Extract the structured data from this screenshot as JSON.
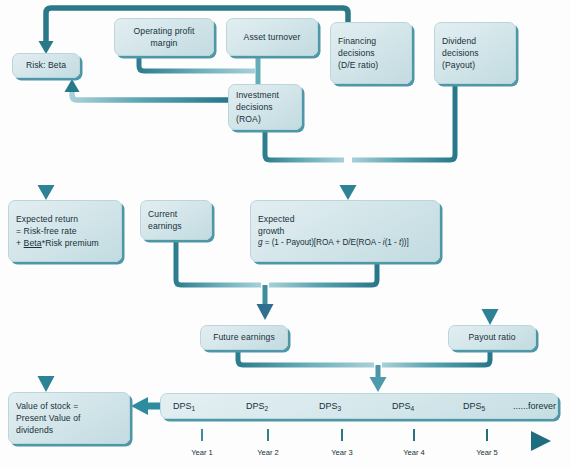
{
  "diagram": {
    "colors": {
      "wire": "#2e8090",
      "wire_dark": "#1d6a7c",
      "wire_light": "#8fc5cf",
      "box_fill": "#d4e6ea",
      "box_border": "#b9d6dd",
      "box_shadow": "#4e97a6",
      "arrow_dark_blue": "#2f6f8f",
      "text": "#18303a",
      "background": "#ffffff"
    },
    "nodes": [
      {
        "id": "risk-beta",
        "label": "Risk: Beta"
      },
      {
        "id": "operating-profit-margin",
        "label": "Operating profit margin"
      },
      {
        "id": "asset-turnover",
        "label": "Asset turnover"
      },
      {
        "id": "financing-decisions",
        "label": "Financing decisions (D/E ratio)"
      },
      {
        "id": "dividend-decisions",
        "label": "Dividend decisions (Payout)"
      },
      {
        "id": "investment-decisions",
        "label": "Investment decisions (ROA)"
      },
      {
        "id": "expected-return",
        "label": "Expected return = Risk-free rate + Beta*Risk premium"
      },
      {
        "id": "current-earnings",
        "label": "Current earnings"
      },
      {
        "id": "expected-growth",
        "label": "Expected growth"
      },
      {
        "id": "future-earnings",
        "label": "Future earnings"
      },
      {
        "id": "payout-ratio",
        "label": "Payout ratio"
      },
      {
        "id": "value-of-stock",
        "label": "Value of stock = Present Value of dividends"
      }
    ],
    "operating_profit_margin": {
      "line1": "Operating profit",
      "line2": "margin"
    },
    "asset_turnover": {
      "line1": "Asset turnover"
    },
    "financing_decisions": {
      "line1": "Financing",
      "line2": "decisions",
      "line3": "(D/E ratio)"
    },
    "dividend_decisions": {
      "line1": "Dividend",
      "line2": "decisions",
      "line3": "(Payout)"
    },
    "investment_decisions": {
      "line1": "Investment",
      "line2": "decisions",
      "line3": "(ROA)"
    },
    "risk_beta": {
      "line1": "Risk: Beta"
    },
    "expected_return": {
      "line1": "Expected return",
      "line2": "= Risk-free rate",
      "line3_prefix": "+ ",
      "line3_underlined": "Beta",
      "line3_suffix": "*Risk premium"
    },
    "current_earnings": {
      "line1": "Current",
      "line2": "earnings"
    },
    "expected_growth": {
      "line1": "Expected",
      "line2": "growth",
      "formula_var": "g",
      "formula_body": " = (1 - Payout)[ROA + D/E(ROA - ",
      "formula_i": "i",
      "formula_mid": "(1 - ",
      "formula_t": "t",
      "formula_end": "))]"
    },
    "future_earnings": {
      "line1": "Future earnings"
    },
    "payout_ratio": {
      "line1": "Payout ratio"
    },
    "value_of_stock": {
      "line1": "Value of stock =",
      "line2": "Present Value of",
      "line3": "dividends"
    },
    "dividend_stream": {
      "items": [
        {
          "base": "DPS",
          "sub": "1"
        },
        {
          "base": "DPS",
          "sub": "2"
        },
        {
          "base": "DPS",
          "sub": "3"
        },
        {
          "base": "DPS",
          "sub": "4"
        },
        {
          "base": "DPS",
          "sub": "5"
        }
      ],
      "forever": "......forever"
    },
    "timeline": {
      "labels": [
        "Year 1",
        "Year 2",
        "Year 3",
        "Year 4",
        "Year 5"
      ]
    }
  }
}
